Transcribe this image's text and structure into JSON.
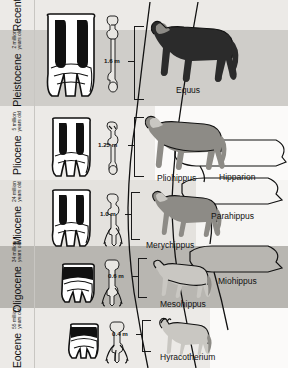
{
  "figure": {
    "type": "evolutionary-timeline-diagram"
  },
  "epochs": [
    {
      "name": "Recent",
      "age": "",
      "age_line1": "",
      "age_line2": "",
      "shade": "light",
      "top": 0,
      "height": 30
    },
    {
      "name": "Pleistocene",
      "age": "2 million years old",
      "age_line1": "2 million",
      "age_line2": "years old",
      "shade": "mid",
      "top": 30,
      "height": 76
    },
    {
      "name": "Pliocene",
      "age": "5 million years old",
      "age_line1": "5 million",
      "age_line2": "years old",
      "shade": "light",
      "top": 106,
      "height": 74
    },
    {
      "name": "Miocene",
      "age": "24 million years old",
      "age_line1": "24 million",
      "age_line2": "years old",
      "shade": "light",
      "top": 180,
      "height": 66
    },
    {
      "name": "Oligocene",
      "age": "34 million years old",
      "age_line1": "34 million",
      "age_line2": "years old",
      "shade": "dark",
      "top": 246,
      "height": 62
    },
    {
      "name": "Eocene",
      "age": "55 million years old",
      "age_line1": "55 million",
      "age_line2": "years old",
      "shade": "light",
      "top": 308,
      "height": 60
    }
  ],
  "measurements": [
    {
      "label": "1.6 m",
      "epoch": "Pleistocene"
    },
    {
      "label": "1.25 m",
      "epoch": "Pliocene"
    },
    {
      "label": "1.0 m",
      "epoch": "Miocene"
    },
    {
      "label": "0.6 m",
      "epoch": "Oligocene"
    },
    {
      "label": "0.4 m",
      "epoch": "Eocene"
    }
  ],
  "genera": [
    {
      "name": "Equus",
      "epoch": "Pleistocene"
    },
    {
      "name": "Pliohippus",
      "epoch": "Pliocene"
    },
    {
      "name": "Hipparion",
      "epoch": "Pliocene"
    },
    {
      "name": "Merychippus",
      "epoch": "Miocene"
    },
    {
      "name": "Parahippus",
      "epoch": "Miocene"
    },
    {
      "name": "Miohippus",
      "epoch": "Oligocene"
    },
    {
      "name": "Mesohippus",
      "epoch": "Oligocene"
    },
    {
      "name": "Hyracotherium",
      "epoch": "Eocene"
    }
  ],
  "columns": {
    "tooth": "molar tooth cross-section",
    "bone": "foreleg / foot bone",
    "height": "shoulder height",
    "animal": "body reconstruction"
  },
  "colors": {
    "band_light": "#eceae7",
    "band_mid": "#cfcdc9",
    "band_dark": "#b8b6b1",
    "ink": "#111111",
    "horse_dark": "#2b2b2b",
    "horse_mid": "#8d8b86",
    "horse_light": "#c9c7c2"
  }
}
